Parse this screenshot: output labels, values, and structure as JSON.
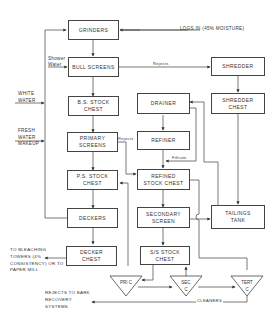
{
  "diagram": {
    "type": "process-flowchart",
    "nodes": {
      "grinders": "GRINDERS",
      "bull_screens": "BULL SCREENS",
      "shredder": "SHREDDER",
      "bs_stock_chest": "B.S. STOCK CHEST",
      "shredder_chest": "SHREDDER CHEST",
      "drainer": "DRAINER",
      "primary_screens": "PRIMARY SCREENS",
      "refiner": "REFINER",
      "ps_stock_chest": "P.S. STOCK CHEST",
      "refined_stock_chest": "REFINED STOCK CHEST",
      "deckers": "DECKERS",
      "secondary_screen": "SECONDARY SCREEN",
      "tailings_tank": "TAILINGS TANK",
      "decker_chest": "DECKER CHEST",
      "ss_stock_chest": "S/S STOCK CHEST",
      "pri_c": "PRI C",
      "sec_c": "SEC C",
      "tert_c": "TERT C"
    },
    "labels": {
      "logs_in": "LOGS IN (45% MOISTURE)",
      "shower_water": "Shower Water",
      "rejects_top": "Rejects",
      "white_water": "WHITE WATER",
      "fresh_water": "FRESH WATER MAKEUP",
      "rejects_mid": "Rejects",
      "filtrate": "Filtrate",
      "to_bleaching": "TO BLEACHING TOWERS (4% CONSISTENCY) OR TO PAPER MILL",
      "rejects_bark": "REJECTS TO BARK RECOVERY SYSTEMS",
      "cleaners": "CLEANERS"
    },
    "edges": [
      [
        "logs_in",
        "grinders"
      ],
      [
        "grinders",
        "bull_screens"
      ],
      [
        "bull_screens",
        "shredder",
        "Rejects"
      ],
      [
        "shredder",
        "shredder_chest"
      ],
      [
        "bull_screens",
        "bs_stock_chest"
      ],
      [
        "bs_stock_chest",
        "primary_screens"
      ],
      [
        "primary_screens",
        "ps_stock_chest"
      ],
      [
        "primary_screens",
        "refined_stock_chest",
        "Rejects"
      ],
      [
        "shredder_chest",
        "tailings_tank"
      ],
      [
        "drainer",
        "refiner"
      ],
      [
        "refiner",
        "refined_stock_chest"
      ],
      [
        "drainer",
        "refined_stock_chest",
        "Filtrate"
      ],
      [
        "refined_stock_chest",
        "secondary_screen"
      ],
      [
        "secondary_screen",
        "tailings_tank"
      ],
      [
        "secondary_screen",
        "ss_stock_chest"
      ],
      [
        "tailings_tank",
        "drainer"
      ],
      [
        "ps_stock_chest",
        "deckers"
      ],
      [
        "deckers",
        "decker_chest"
      ],
      [
        "deckers",
        "grinders",
        "white water return"
      ],
      [
        "white_water",
        "loop"
      ],
      [
        "shower_water",
        "bull_screens"
      ],
      [
        "fresh_water",
        "loop"
      ],
      [
        "decker_chest",
        "to_bleaching"
      ],
      [
        "ss_stock_chest",
        "pri_c"
      ],
      [
        "pri_c",
        "ps_stock_chest"
      ],
      [
        "pri_c",
        "sec_c"
      ],
      [
        "sec_c",
        "ss_stock_chest"
      ],
      [
        "sec_c",
        "tert_c"
      ],
      [
        "refined_stock_chest",
        "tert_c"
      ],
      [
        "tert_c",
        "rejects_bark"
      ]
    ]
  }
}
